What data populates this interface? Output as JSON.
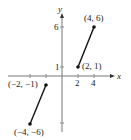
{
  "figure": {
    "axes": {
      "x_label": "x",
      "y_label": "y"
    },
    "ticks": {
      "x": [
        "2",
        "4"
      ],
      "y": [
        "1",
        "6"
      ]
    },
    "segments": [
      {
        "from": "(2, 1)",
        "to": "(4, 6)"
      },
      {
        "from": "(-2, -1)",
        "to": "(-4, -6)"
      }
    ],
    "points": [
      {
        "label": "(4, 6)",
        "x": 4,
        "y": 6
      },
      {
        "label": "(2, 1)",
        "x": 2,
        "y": 1
      },
      {
        "label": "(−2, −1)",
        "x": -2,
        "y": -1
      },
      {
        "label": "(−4, −6)",
        "x": -4,
        "y": -6
      }
    ]
  }
}
